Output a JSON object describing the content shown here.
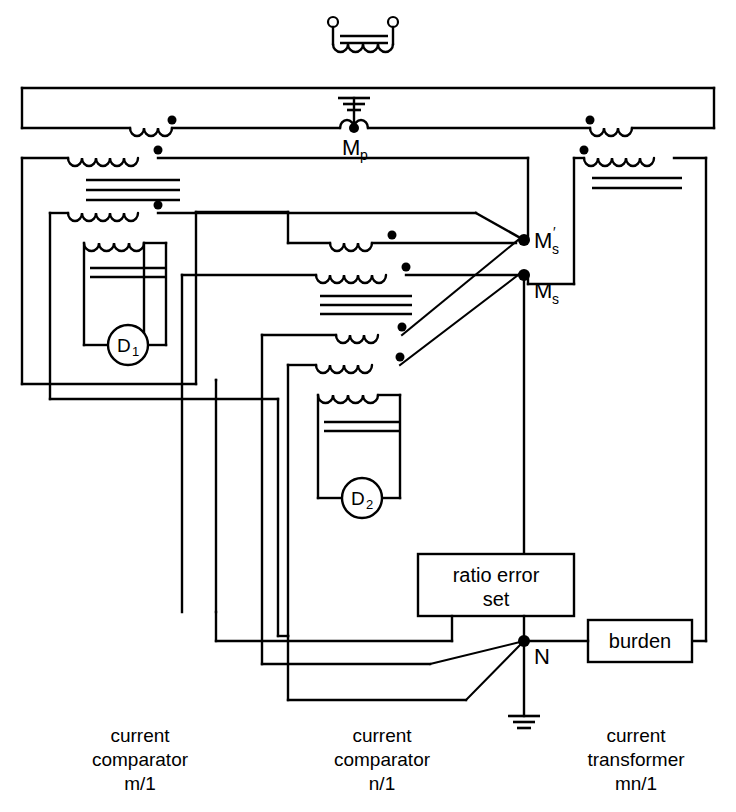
{
  "diagram": {
    "type": "electrical-schematic",
    "background_color": "#ffffff",
    "line_color": "#000000"
  },
  "nodes": {
    "mp": {
      "label": "M",
      "subscript": "p"
    },
    "ms_prime": {
      "label": "M",
      "subscript": "s",
      "prime": "′"
    },
    "ms": {
      "label": "M",
      "subscript": "s"
    },
    "n": {
      "label": "N"
    }
  },
  "detectors": [
    {
      "label": "D",
      "subscript": "1",
      "name": "detector-d1"
    },
    {
      "label": "D",
      "subscript": "2",
      "name": "detector-d2"
    }
  ],
  "boxes": {
    "ratio_error_set": {
      "line1": "ratio error",
      "line2": "set"
    },
    "burden": {
      "line1": "burden"
    }
  },
  "captions": [
    {
      "line1": "current",
      "line2": "comparator",
      "line3": "m/1"
    },
    {
      "line1": "current",
      "line2": "comparator",
      "line3": "n/1"
    },
    {
      "line1": "current",
      "line2": "transformer",
      "line3": "mn/1"
    }
  ],
  "symbols": {
    "source": "supply-source-transformer",
    "ground_top": "earth-ground",
    "ground_bottom": "earth-ground",
    "polarity_dot": "polarity-dot",
    "junction_dot": "junction-dot"
  }
}
